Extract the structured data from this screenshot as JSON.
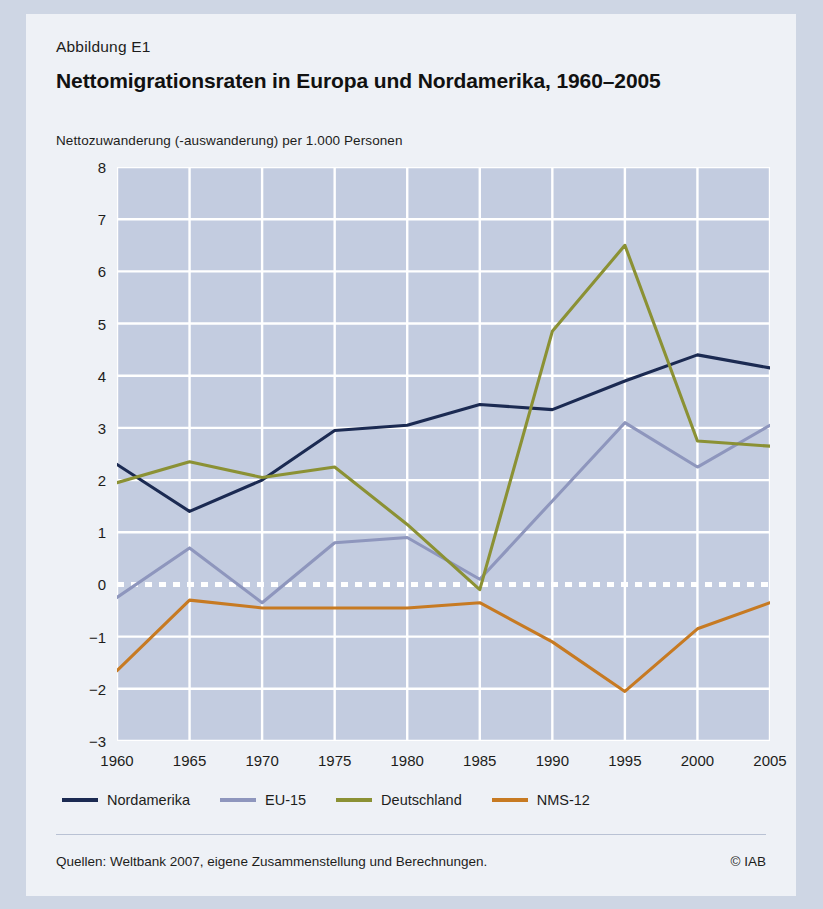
{
  "figure": {
    "label": "Abbildung E1",
    "title": "Nettomigrationsraten in Europa und Nordamerika, 1960–2005",
    "subtitle": "Nettozuwanderung (-auswanderung) per 1.000 Personen",
    "source": "Quellen: Weltbank 2007, eigene Zusammenstellung und Berechnungen.",
    "copyright": "© IAB"
  },
  "chart_data": {
    "type": "line",
    "title": "Nettomigrationsraten in Europa und Nordamerika, 1960–2005",
    "subtitle": "Nettozuwanderung (-auswanderung) per 1.000 Personen",
    "xlabel": "",
    "ylabel": "Nettozuwanderung (-auswanderung) per 1.000 Personen",
    "x": [
      1960,
      1965,
      1970,
      1975,
      1980,
      1985,
      1990,
      1995,
      2000,
      2005
    ],
    "xtick_labels": [
      "1960",
      "1965",
      "1970",
      "1975",
      "1980",
      "1985",
      "1990",
      "1995",
      "2000",
      "2005"
    ],
    "ytick_labels": [
      "8",
      "7",
      "6",
      "5",
      "4",
      "3",
      "2",
      "1",
      "0",
      "−1",
      "−2",
      "−3"
    ],
    "yticks": [
      8,
      7,
      6,
      5,
      4,
      3,
      2,
      1,
      0,
      -1,
      -2,
      -3
    ],
    "ylim": [
      -3,
      8
    ],
    "xlim": [
      1960,
      2005
    ],
    "grid": true,
    "zero_line": true,
    "legend_position": "bottom",
    "plot_background": "#c3cce0",
    "series": [
      {
        "name": "Nordamerika",
        "color": "#1b2a52",
        "values": [
          2.3,
          1.4,
          2.0,
          2.95,
          3.05,
          3.45,
          3.35,
          3.9,
          4.4,
          4.15
        ]
      },
      {
        "name": "EU-15",
        "color": "#8e96bd",
        "values": [
          -0.25,
          0.7,
          -0.35,
          0.8,
          0.9,
          0.1,
          1.6,
          3.1,
          2.25,
          3.05
        ]
      },
      {
        "name": "Deutschland",
        "color": "#8b9134",
        "values": [
          1.95,
          2.35,
          2.05,
          2.25,
          1.15,
          -0.1,
          4.85,
          6.5,
          2.75,
          2.65
        ]
      },
      {
        "name": "NMS-12",
        "color": "#c77a22",
        "values": [
          -1.65,
          -0.3,
          -0.45,
          -0.45,
          -0.45,
          -0.35,
          -1.1,
          -2.05,
          -0.85,
          -0.35
        ]
      }
    ]
  },
  "colors": {
    "page_background": "#ced6e4",
    "figure_background": "#eef1f6",
    "plot_background": "#c3cce0",
    "gridline": "#ffffff",
    "text": "#1d1d1b"
  }
}
